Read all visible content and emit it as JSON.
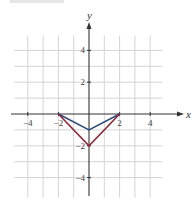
{
  "chart_data": {
    "type": "line",
    "title": "",
    "xlabel": "x",
    "ylabel": "y",
    "xlim": [
      -5,
      5
    ],
    "ylim": [
      -5,
      5
    ],
    "grid": true,
    "x_ticks": [
      -4,
      -2,
      2,
      4
    ],
    "y_ticks": [
      4,
      2,
      -2,
      -4
    ],
    "x_tick_labels": [
      "−4",
      "−2",
      "2",
      "4"
    ],
    "y_tick_labels": [
      "4",
      "2",
      "−2",
      "−4"
    ],
    "series": [
      {
        "name": "blue",
        "color": "#2e4a7a",
        "points": [
          [
            -2,
            0
          ],
          [
            0,
            -1
          ],
          [
            2,
            0
          ]
        ]
      },
      {
        "name": "red",
        "color": "#8b2a3a",
        "points": [
          [
            -2,
            0
          ],
          [
            0,
            -2
          ],
          [
            2,
            0
          ]
        ]
      }
    ],
    "legend": null
  },
  "colors": {
    "grid": "#d4d4d4",
    "axis": "#333333",
    "text": "#444444"
  }
}
